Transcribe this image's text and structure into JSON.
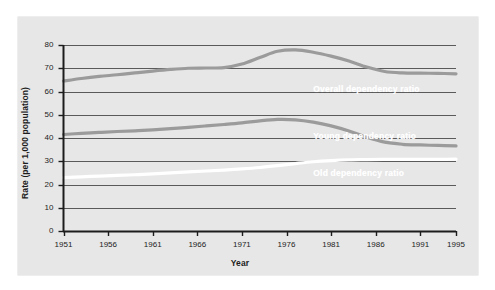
{
  "figure": {
    "background_color": "#ffffff",
    "panel_color": "#e7e7e7",
    "line_color": "#9b9b9b",
    "highlight_line_color": "#ffffff",
    "axis_color": "#1c1c1c",
    "gridline_color": "#5a5a5a"
  },
  "chart_data": {
    "type": "line",
    "title": "",
    "xlabel": "Year",
    "ylabel": "Rate (per 1,000 population)",
    "xlim": [
      1951,
      1995
    ],
    "ylim": [
      0,
      80
    ],
    "ytick_labels": [
      "0",
      "10",
      "20",
      "30",
      "40",
      "50",
      "60",
      "70",
      "80"
    ],
    "yticks": [
      0,
      10,
      20,
      30,
      40,
      50,
      60,
      70,
      80
    ],
    "xtick_labels": [
      "1951",
      "1956",
      "1961",
      "1966",
      "1971",
      "1976",
      "1981",
      "1986",
      "1991",
      "1995"
    ],
    "xticks": [
      1951,
      1956,
      1961,
      1966,
      1971,
      1976,
      1981,
      1986,
      1991,
      1995
    ],
    "grid": true,
    "grid_axis": "y",
    "legend_position": "inline-labels",
    "x": [
      1951,
      1953,
      1955,
      1957,
      1959,
      1961,
      1963,
      1965,
      1967,
      1969,
      1971,
      1973,
      1975,
      1977,
      1979,
      1981,
      1983,
      1985,
      1987,
      1989,
      1991,
      1993,
      1995
    ],
    "series": [
      {
        "name": "Overall dependency ratio",
        "color": "#9b9b9b",
        "label_x": 1979,
        "label_y": 61,
        "values": [
          64.5,
          65.6,
          66.5,
          67.2,
          68.0,
          68.8,
          69.5,
          70.0,
          70.1,
          70.3,
          71.8,
          74.6,
          77.3,
          77.9,
          76.9,
          75.2,
          73.1,
          70.5,
          68.6,
          68.0,
          67.9,
          67.8,
          67.6
        ]
      },
      {
        "name": "Young dependency ratio",
        "color": "#9b9b9b",
        "label_x": 1979,
        "label_y": 41,
        "values": [
          41.5,
          42.0,
          42.4,
          42.8,
          43.1,
          43.5,
          44.0,
          44.6,
          45.2,
          45.8,
          46.5,
          47.4,
          48.0,
          47.8,
          46.8,
          45.2,
          43.0,
          40.3,
          38.2,
          37.3,
          37.0,
          36.8,
          36.6
        ]
      },
      {
        "name": "Old dependency ratio",
        "color": "#ffffff",
        "label_x": 1979,
        "label_y": 25,
        "values": [
          23.0,
          23.3,
          23.6,
          23.9,
          24.2,
          24.6,
          25.0,
          25.4,
          25.8,
          26.2,
          26.7,
          27.3,
          28.1,
          29.0,
          29.8,
          30.3,
          30.6,
          30.7,
          30.8,
          30.8,
          30.8,
          30.8,
          30.9
        ]
      }
    ]
  }
}
